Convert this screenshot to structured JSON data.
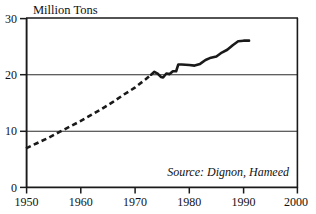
{
  "chart_data": {
    "type": "line",
    "title": "Million Tons",
    "xlabel": "",
    "ylabel": "Million Tons",
    "xlim": [
      1950,
      2000
    ],
    "ylim": [
      0,
      30
    ],
    "xticks": [
      "1950",
      "1960",
      "1970",
      "1980",
      "1990",
      "2000"
    ],
    "xtick_values": [
      1950,
      1960,
      1970,
      1980,
      1990,
      2000
    ],
    "yticks": [
      "0",
      "10",
      "20",
      "30"
    ],
    "ytick_values": [
      0,
      10,
      20,
      30
    ],
    "grid": "horizontal-gridlines-at-10-and-20",
    "legend": "none",
    "annotation": "Source: Dignon, Hameed",
    "series": [
      {
        "name": "Estimated (dashed)",
        "style": "dashed",
        "x": [
          1950,
          1952,
          1954,
          1956,
          1958,
          1960,
          1962,
          1964,
          1966,
          1968,
          1970,
          1972,
          1973
        ],
        "values": [
          7.0,
          7.9,
          8.8,
          9.8,
          10.8,
          11.8,
          12.9,
          14.0,
          15.2,
          16.5,
          17.7,
          19.2,
          20.0
        ]
      },
      {
        "name": "Measured (solid)",
        "style": "solid",
        "x": [
          1973,
          1973.6,
          1974.2,
          1974.8,
          1975.2,
          1975.8,
          1976.4,
          1977,
          1977.6,
          1978,
          1978.6,
          1980,
          1981,
          1982,
          1983,
          1984,
          1985,
          1986,
          1987,
          1988,
          1989,
          1990,
          1991
        ],
        "values": [
          20.0,
          20.5,
          20.2,
          19.6,
          19.5,
          20.2,
          20.1,
          20.6,
          20.6,
          21.8,
          21.8,
          21.7,
          21.6,
          21.9,
          22.6,
          23.0,
          23.2,
          23.9,
          24.4,
          25.2,
          25.9,
          26.0,
          26.0
        ]
      }
    ]
  },
  "frame": {
    "plot_left_px": 26,
    "plot_right_px": 298,
    "plot_top_px": 18,
    "plot_bottom_px": 188
  },
  "icons": {
    "chart_icon": "line-chart-icon"
  }
}
